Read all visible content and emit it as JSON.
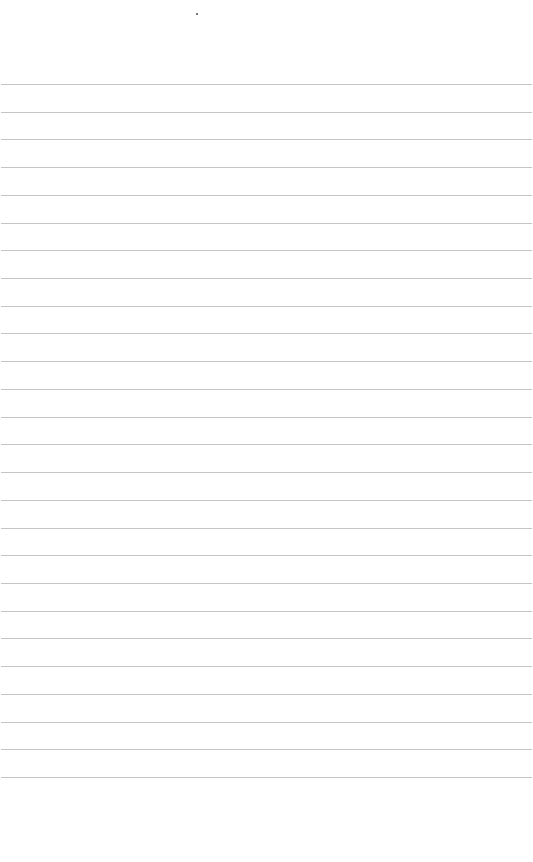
{
  "page": {
    "type": "lined-paper",
    "background": "#ffffff",
    "line_color": "#c4c4c4",
    "line_count": 26,
    "first_line_y": 84,
    "line_spacing": 27.72
  }
}
